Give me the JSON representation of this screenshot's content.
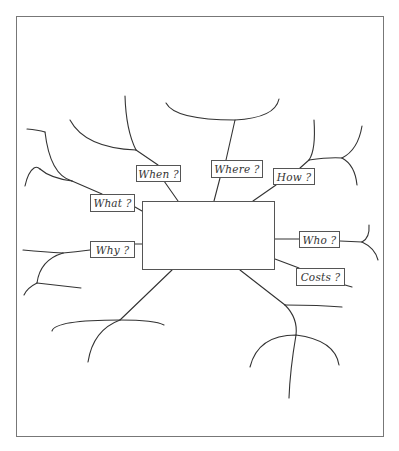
{
  "diagram": {
    "type": "mind-map",
    "title": "",
    "central_topic": "",
    "branches": [
      {
        "id": "when",
        "label": "When ?",
        "box": [
          136,
          165,
          45,
          17
        ],
        "anchor": [
          178,
          201
        ]
      },
      {
        "id": "where",
        "label": "Where ?",
        "box": [
          211,
          160,
          52,
          18
        ],
        "anchor": [
          214,
          201
        ]
      },
      {
        "id": "how",
        "label": "How ?",
        "box": [
          273,
          168,
          42,
          17
        ],
        "anchor": [
          253,
          201
        ]
      },
      {
        "id": "what",
        "label": "What ?",
        "box": [
          90,
          194,
          45,
          18
        ],
        "anchor": [
          142,
          211
        ]
      },
      {
        "id": "why",
        "label": "Why ?",
        "box": [
          90,
          241,
          45,
          17
        ],
        "anchor": [
          142,
          244
        ]
      },
      {
        "id": "who",
        "label": "Who ?",
        "box": [
          299,
          231,
          41,
          17
        ],
        "anchor": [
          275,
          239
        ]
      },
      {
        "id": "costs",
        "label": "Costs ?",
        "box": [
          296,
          268,
          49,
          18
        ],
        "anchor": [
          275,
          259
        ]
      }
    ],
    "central_box": [
      142,
      201,
      133,
      69
    ],
    "frame": [
      16,
      16,
      368,
      421
    ],
    "colors": {
      "line": "#333333",
      "frame": "#777777",
      "box_border": "#555555",
      "text": "#333333",
      "background": "#ffffff"
    }
  }
}
